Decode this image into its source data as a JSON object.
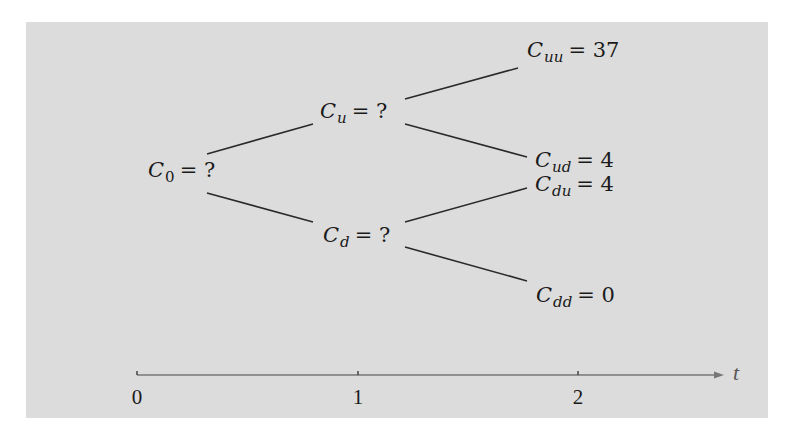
{
  "diagram": {
    "type": "binomial-tree",
    "background_color": "#dcdcdc",
    "line_color": "#2a2a2a",
    "nodes": [
      {
        "id": "C0",
        "symbol": "C",
        "subscript": "0",
        "subscript_numeric": true,
        "eq": "= ?",
        "x": 148,
        "y": 160
      },
      {
        "id": "Cu",
        "symbol": "C",
        "subscript": "u",
        "subscript_numeric": false,
        "eq": "= ?",
        "x": 320,
        "y": 101
      },
      {
        "id": "Cd",
        "symbol": "C",
        "subscript": "d",
        "subscript_numeric": false,
        "eq": "= ?",
        "x": 323,
        "y": 225
      },
      {
        "id": "Cuu",
        "symbol": "C",
        "subscript": "uu",
        "subscript_numeric": false,
        "eq": "= 37",
        "x": 527,
        "y": 40
      },
      {
        "id": "Cud",
        "symbol": "C",
        "subscript": "ud",
        "subscript_numeric": false,
        "eq": "= 4",
        "x": 535,
        "y": 150
      },
      {
        "id": "Cdu",
        "symbol": "C",
        "subscript": "du",
        "subscript_numeric": false,
        "eq": "= 4",
        "x": 535,
        "y": 174
      },
      {
        "id": "Cdd",
        "symbol": "C",
        "subscript": "dd",
        "subscript_numeric": false,
        "eq": "= 0",
        "x": 536,
        "y": 285
      }
    ],
    "edges": [
      {
        "from": "C0",
        "to": "Cu",
        "x1": 207,
        "y1": 154,
        "x2": 313,
        "y2": 124
      },
      {
        "from": "C0",
        "to": "Cd",
        "x1": 207,
        "y1": 193,
        "x2": 313,
        "y2": 222
      },
      {
        "from": "Cu",
        "to": "Cuu",
        "x1": 405,
        "y1": 99,
        "x2": 518,
        "y2": 68
      },
      {
        "from": "Cu",
        "to": "Cud",
        "x1": 405,
        "y1": 124,
        "x2": 527,
        "y2": 157
      },
      {
        "from": "Cd",
        "to": "Cdu",
        "x1": 405,
        "y1": 222,
        "x2": 527,
        "y2": 188
      },
      {
        "from": "Cd",
        "to": "Cdd",
        "x1": 405,
        "y1": 247,
        "x2": 527,
        "y2": 281
      }
    ],
    "time_axis": {
      "variable": "t",
      "color": "#777777",
      "y": 375,
      "x_start": 137,
      "x_end": 724,
      "ticks": [
        {
          "label": "0",
          "x": 137
        },
        {
          "label": "1",
          "x": 358
        },
        {
          "label": "2",
          "x": 578
        }
      ]
    }
  }
}
